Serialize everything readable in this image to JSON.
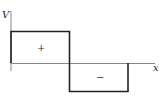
{
  "diagram": {
    "type": "square-wave potential",
    "y_axis_label": "V",
    "x_axis_label": "x",
    "positive_region_label": "+",
    "negative_region_label": "−",
    "colors": {
      "axis": "#777777",
      "waveform": "#222222",
      "background": "#ffffff"
    }
  }
}
